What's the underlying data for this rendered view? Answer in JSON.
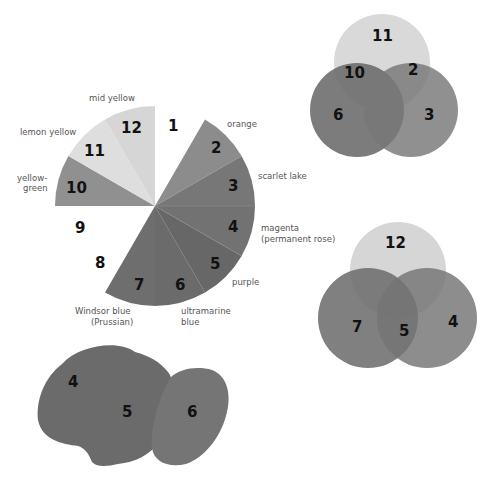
{
  "colour_wheel": {
    "center": [
      155,
      206
    ],
    "radius": 100,
    "segments": [
      {
        "number": "1",
        "label": "",
        "color": null
      },
      {
        "number": "2",
        "label": "orange",
        "color": "#8c8c8c"
      },
      {
        "number": "3",
        "label": "scarlet lake",
        "color": "#777777"
      },
      {
        "number": "4",
        "label_lines": [
          "magenta",
          "(permanent rose)"
        ],
        "color": "#717171"
      },
      {
        "number": "5",
        "label": "purple",
        "color": "#666666"
      },
      {
        "number": "6",
        "label_lines": [
          "ultramarine",
          "blue"
        ],
        "color": "#6b6b6b"
      },
      {
        "number": "7",
        "label_lines": [
          "Windsor blue",
          "(Prussian)"
        ],
        "color": "#6e6e6e"
      },
      {
        "number": "8",
        "label": "",
        "color": null
      },
      {
        "number": "9",
        "label": "",
        "color": null
      },
      {
        "number": "10",
        "label_lines": [
          "yellow-",
          "green"
        ],
        "color": "#909090"
      },
      {
        "number": "11",
        "label": "lemon yellow",
        "color": "#dddddd"
      },
      {
        "number": "12",
        "label": "mid yellow",
        "color": "#d6d6d6"
      }
    ]
  },
  "venn_top": {
    "circles": [
      {
        "number": "11",
        "color": "#d9d9d9"
      },
      {
        "number": "6",
        "color": "#6a6a6a"
      },
      {
        "number": "3",
        "color": "#777777"
      }
    ],
    "overlaps": [
      {
        "number": "10"
      },
      {
        "number": "2"
      }
    ]
  },
  "venn_bottom": {
    "circles": [
      {
        "number": "12",
        "color": "#d6d6d6"
      },
      {
        "number": "7",
        "color": "#6e6e6e"
      },
      {
        "number": "4",
        "color": "#747474"
      }
    ],
    "overlaps": [
      {
        "number": "5"
      }
    ]
  },
  "blobs": [
    {
      "number": "4",
      "color": "#6e6e6e"
    },
    {
      "number": "5",
      "color": "#666666"
    },
    {
      "number": "6",
      "color": "#757575"
    }
  ]
}
